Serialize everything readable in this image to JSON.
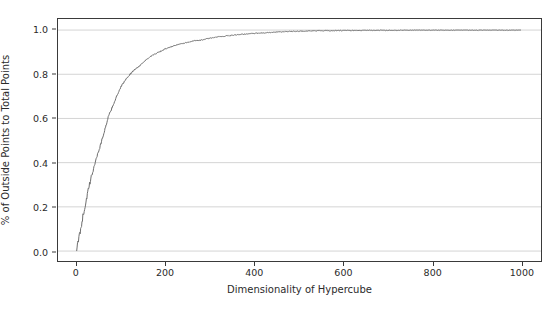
{
  "chart_data": {
    "type": "line",
    "title": "",
    "xlabel": "Dimensionality of Hypercube",
    "ylabel": "% of Outside Points to Total Points",
    "xlim": [
      -42,
      1045
    ],
    "ylim": [
      -0.045,
      1.05
    ],
    "xticks": [
      0,
      200,
      400,
      600,
      800,
      1000
    ],
    "xticklabels": [
      "0",
      "200",
      "400",
      "600",
      "800",
      "1000"
    ],
    "yticks": [
      0.0,
      0.2,
      0.4,
      0.6,
      0.8,
      1.0
    ],
    "yticklabels": [
      "0.0",
      "0.2",
      "0.4",
      "0.6",
      "0.8",
      "1.0"
    ],
    "grid": true,
    "grid_axis": "y",
    "grid_color": "#d4d4d4",
    "line_color": "#6e6e6e",
    "line_width": 1.0,
    "legend": null,
    "series": [
      {
        "name": "% outside points",
        "x": [
          0,
          5,
          10,
          15,
          20,
          25,
          30,
          35,
          40,
          45,
          50,
          55,
          60,
          65,
          70,
          75,
          80,
          85,
          90,
          95,
          100,
          110,
          120,
          130,
          140,
          150,
          160,
          170,
          180,
          190,
          200,
          220,
          240,
          260,
          280,
          300,
          320,
          340,
          360,
          380,
          400,
          425,
          450,
          475,
          500,
          550,
          600,
          650,
          700,
          750,
          800,
          850,
          900,
          950,
          1000
        ],
        "y": [
          0.0,
          0.055,
          0.115,
          0.165,
          0.215,
          0.265,
          0.31,
          0.35,
          0.39,
          0.425,
          0.455,
          0.49,
          0.525,
          0.56,
          0.6,
          0.625,
          0.65,
          0.675,
          0.7,
          0.72,
          0.745,
          0.775,
          0.8,
          0.82,
          0.835,
          0.855,
          0.87,
          0.885,
          0.895,
          0.905,
          0.915,
          0.93,
          0.94,
          0.95,
          0.955,
          0.963,
          0.97,
          0.974,
          0.978,
          0.982,
          0.985,
          0.988,
          0.991,
          0.993,
          0.995,
          0.997,
          0.998,
          0.999,
          0.999,
          1.0,
          1.0,
          1.0,
          1.0,
          1.0,
          1.0
        ]
      }
    ],
    "noise": {
      "description": "Monte Carlo sampling jitter superimposed on the saturation curve; amplitude decays as the curve approaches 1.0",
      "amplitude_near_zero": 0.02,
      "amplitude_at_plateau": 0.002
    },
    "annotations": []
  }
}
